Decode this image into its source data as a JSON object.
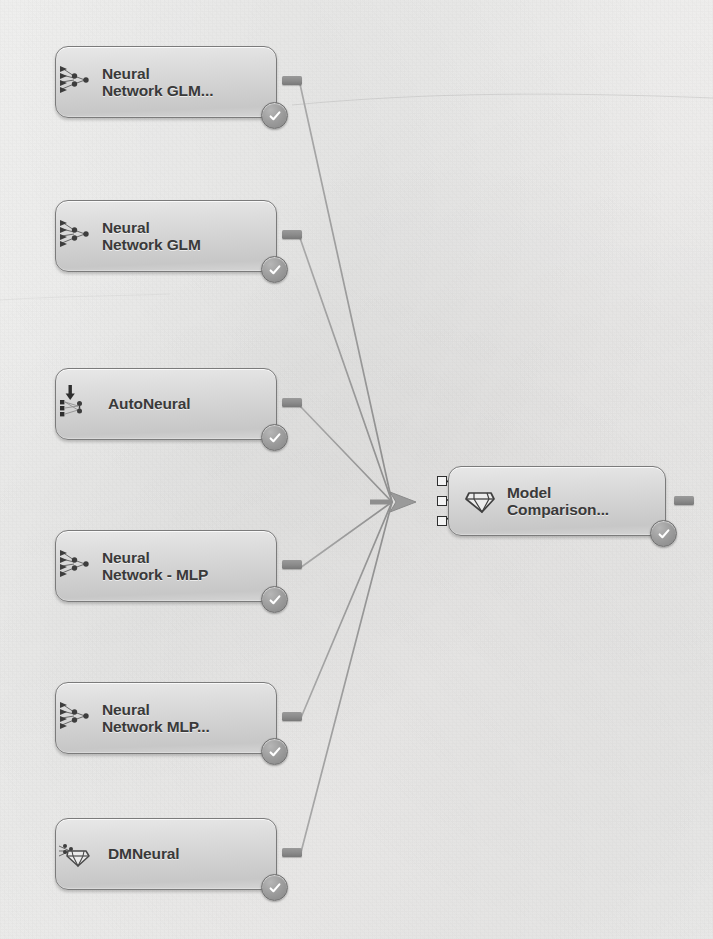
{
  "diagram": {
    "type": "process-flow",
    "palette": {
      "background": "#f2f1f0",
      "node_fill_top": "#e8e8e8",
      "node_fill_bottom": "#c7c7c7",
      "node_border": "#7b7b7b",
      "label_text": "#3a3a3a",
      "edge_line": "#9a9a9a",
      "status_badge": "#8f8f8f",
      "port_border": "#2f2f2f"
    },
    "nodes": [
      {
        "id": "neural-network-glm-2",
        "label_lines": [
          "Neural",
          "Network GLM..."
        ],
        "icon": "neural-network-icon",
        "status": "complete-check",
        "x": 55,
        "y": 46,
        "w": 222,
        "h": 72
      },
      {
        "id": "neural-network-glm",
        "label_lines": [
          "Neural",
          "Network GLM"
        ],
        "icon": "neural-network-icon",
        "status": "complete-check",
        "x": 55,
        "y": 200,
        "w": 222,
        "h": 72
      },
      {
        "id": "autoneural",
        "label_lines": [
          "AutoNeural"
        ],
        "icon": "autoneural-icon",
        "status": "complete-check",
        "x": 55,
        "y": 368,
        "w": 222,
        "h": 72
      },
      {
        "id": "neural-network-mlp",
        "label_lines": [
          "Neural",
          "Network - MLP"
        ],
        "icon": "neural-network-icon",
        "status": "complete-check",
        "x": 55,
        "y": 530,
        "w": 222,
        "h": 72
      },
      {
        "id": "neural-network-mlp-2",
        "label_lines": [
          "Neural",
          "Network MLP..."
        ],
        "icon": "neural-network-icon",
        "status": "complete-check",
        "x": 55,
        "y": 682,
        "w": 222,
        "h": 72
      },
      {
        "id": "dmneural",
        "label_lines": [
          "DMNeural"
        ],
        "icon": "diamond-model-icon",
        "status": "complete-check",
        "x": 55,
        "y": 818,
        "w": 222,
        "h": 72
      },
      {
        "id": "model-comparison",
        "label_lines": [
          "Model",
          "Comparison..."
        ],
        "icon": "diamond-model-icon",
        "status": "complete-check",
        "x": 448,
        "y": 466,
        "w": 218,
        "h": 70
      }
    ],
    "edges": [
      {
        "from": "neural-network-glm-2",
        "to": "model-comparison"
      },
      {
        "from": "neural-network-glm",
        "to": "model-comparison"
      },
      {
        "from": "autoneural",
        "to": "model-comparison"
      },
      {
        "from": "neural-network-mlp",
        "to": "model-comparison"
      },
      {
        "from": "neural-network-mlp-2",
        "to": "model-comparison"
      },
      {
        "from": "dmneural",
        "to": "model-comparison"
      }
    ],
    "convergence_point": {
      "x": 392,
      "y": 502
    },
    "model_comparison_input_ports": 3,
    "page_artifacts": {
      "bleed_line_1": "",
      "bleed_line_2": ""
    }
  }
}
